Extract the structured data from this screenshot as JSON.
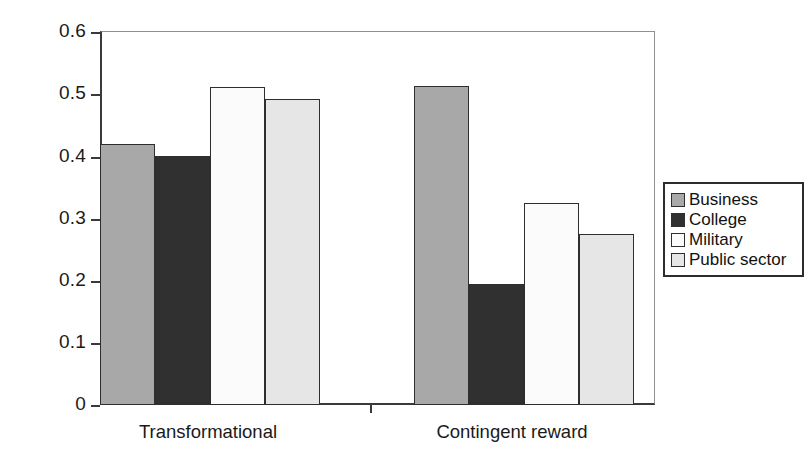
{
  "chart_data": {
    "type": "bar",
    "title": "",
    "xlabel": "",
    "ylabel": "",
    "categories": [
      "Transformational",
      "Contingent reward"
    ],
    "series": [
      {
        "name": "Business",
        "values": [
          0.42,
          0.513
        ],
        "color": "#a8a8a8"
      },
      {
        "name": "College",
        "values": [
          0.4,
          0.195
        ],
        "color": "#303030"
      },
      {
        "name": "Military",
        "values": [
          0.512,
          0.325
        ],
        "color": "#fbfbfb"
      },
      {
        "name": "Public sector",
        "values": [
          0.492,
          0.275
        ],
        "color": "#e6e6e6"
      }
    ],
    "ylim": [
      0,
      0.6
    ],
    "ytick_labels": [
      "0",
      "0.1",
      "0.2",
      "0.3",
      "0.4",
      "0.5",
      "0.6"
    ],
    "ytick_values": [
      0,
      0.1,
      0.2,
      0.3,
      0.4,
      0.5,
      0.6
    ],
    "grid": false,
    "legend_position": "right",
    "legend_entries": [
      "Business",
      "College",
      "Military",
      "Public sector"
    ],
    "bar_gap_within_group": 0,
    "axis_colors": {
      "axis_line": "#3a3a3a",
      "frame_line": "#8f8f8f",
      "bar_outline": "#2e2e2e",
      "text": "#1a1a1a"
    }
  }
}
